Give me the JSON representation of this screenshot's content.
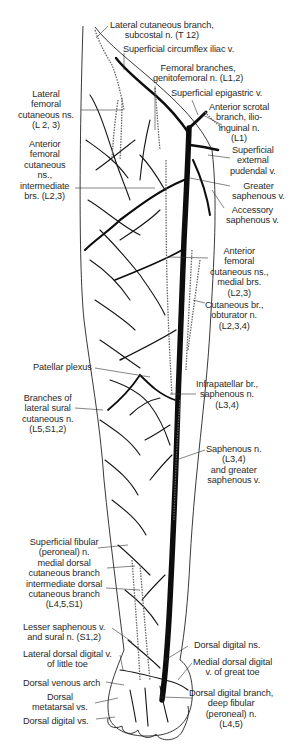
{
  "figure": {
    "colors": {
      "vein": "#111111",
      "nerve": "#555555",
      "leader": "#333333",
      "background": "#ffffff"
    },
    "labels": [
      {
        "id": "lat-cut-subcostal",
        "text": "Lateral cutaneous branch,\nsubcostal n. (T 12)",
        "x": 110,
        "y": 23,
        "align": "c"
      },
      {
        "id": "sup-circ-iliac",
        "text": "Superficial circumflex iliac v.",
        "x": 123,
        "y": 47,
        "align": "l"
      },
      {
        "id": "femoral-br-genitofem",
        "text": "Femoral branches,\ngenitofemoral n. (L1,2)",
        "x": 152,
        "y": 64,
        "align": "c"
      },
      {
        "id": "sup-epigastric",
        "text": "Superficial epigastric v.",
        "x": 170,
        "y": 90,
        "align": "l"
      },
      {
        "id": "lat-fem-cut",
        "text": "Lateral\nfemoral\ncutaneous ns.\n(L 2, 3)",
        "x": 14,
        "y": 88,
        "align": "c"
      },
      {
        "id": "ant-scrotal-ilioinguinal",
        "text": "Anterior scrotal\nbranch, ilio-\ninguinal n.\n(L1)",
        "x": 208,
        "y": 104,
        "align": "c"
      },
      {
        "id": "sup-ext-pudendal",
        "text": "Superficial\nexternal\npudendal v.",
        "x": 228,
        "y": 145,
        "align": "c"
      },
      {
        "id": "ant-fem-cut-intermediate",
        "text": "Anterior\nfemoral\ncutaneous\nns.,\nintermediate\nbrs. (L2,3)",
        "x": 20,
        "y": 139,
        "align": "c"
      },
      {
        "id": "greater-saphenous",
        "text": "Greater\nsaphenous v.",
        "x": 229,
        "y": 181,
        "align": "c"
      },
      {
        "id": "accessory-saphenous",
        "text": "Accessory\nsaphenous v.",
        "x": 222,
        "y": 205,
        "align": "c"
      },
      {
        "id": "ant-fem-cut-medial",
        "text": "Anterior\nfemoral\ncutaneous ns.,\nmedial brs.\n(L2,3)",
        "x": 210,
        "y": 245,
        "align": "c"
      },
      {
        "id": "cut-br-obturator",
        "text": "Cutaneous br.,\nobturator n.\n(L2,3,4)",
        "x": 205,
        "y": 300,
        "align": "c"
      },
      {
        "id": "patellar-plexus",
        "text": "Patellar plexus",
        "x": 33,
        "y": 364,
        "align": "l"
      },
      {
        "id": "infrapatellar-saphenous",
        "text": "Infrapatellar br.,\nsaphenous n.\n(L3,4)",
        "x": 196,
        "y": 378,
        "align": "c"
      },
      {
        "id": "lat-sural-branches",
        "text": "Branches of\nlateral sural\ncutaneous n.\n(L5,S1,2)",
        "x": 18,
        "y": 393,
        "align": "c"
      },
      {
        "id": "saphenous-n-greater-v",
        "text": "Saphenous n.\n(L3,4)\nand greater\nsaphenous v.",
        "x": 205,
        "y": 445,
        "align": "c"
      },
      {
        "id": "sup-fibular",
        "text": "Superficial fibular\n(peroneal) n.\nmedial dorsal\ncutaneous branch\nintermediate dorsal\ncutaneous branch\n(L4,5,S1)",
        "x": 24,
        "y": 535,
        "align": "c"
      },
      {
        "id": "lesser-saphenous-sural",
        "text": "Lesser saphenous v.\nand sural n. (S1,2)",
        "x": 24,
        "y": 620,
        "align": "c"
      },
      {
        "id": "dorsal-digital-ns",
        "text": "Dorsal digital ns.",
        "x": 194,
        "y": 643,
        "align": "l"
      },
      {
        "id": "lat-dorsal-digital-little",
        "text": "Lateral dorsal digital v.\nof little toe",
        "x": 23,
        "y": 649,
        "align": "c"
      },
      {
        "id": "medial-dorsal-digital-great",
        "text": "Medial dorsal digital\nv. of great toe",
        "x": 193,
        "y": 658,
        "align": "c"
      },
      {
        "id": "dorsal-venous-arch",
        "text": "Dorsal venous arch",
        "x": 23,
        "y": 677,
        "align": "l"
      },
      {
        "id": "dorsal-metatarsal",
        "text": "Dorsal\nmetatarsal vs.",
        "x": 32,
        "y": 691,
        "align": "c"
      },
      {
        "id": "dorsal-digital-branch-deep-fibular",
        "text": "Dorsal digital branch,\ndeep fibular\n(peroneal) n.\n(L4,5)",
        "x": 189,
        "y": 686,
        "align": "c"
      },
      {
        "id": "dorsal-digital-vs",
        "text": "Dorsal digital vs.",
        "x": 23,
        "y": 715,
        "align": "l"
      }
    ]
  }
}
